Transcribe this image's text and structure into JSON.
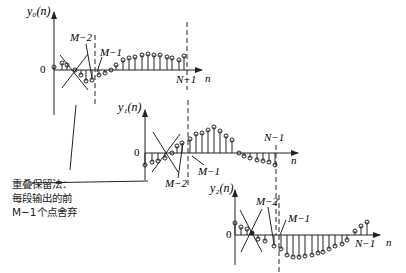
{
  "figure": {
    "colors": {
      "ink": "#222222",
      "background": "#ffffff"
    }
  },
  "panels": [
    {
      "ylabel": "y₀(n)",
      "zero_label": "0",
      "x_label": "n",
      "markers": {
        "m2": "M−2",
        "m1": "M−1",
        "n1": "N−1"
      }
    },
    {
      "ylabel": "y₁(n)",
      "zero_label": "0",
      "x_label": "n",
      "markers": {
        "m2": "M−2",
        "m1": "M−1",
        "n1": "N−1"
      }
    },
    {
      "ylabel": "y₂(n)",
      "zero_label": "0",
      "x_label": "n",
      "markers": {
        "m2": "M−2",
        "m1": "M−1",
        "n1": "N−1"
      }
    }
  ],
  "annotation": {
    "line1": "重叠保留法：",
    "line2": "每段输出的前",
    "line3": "M−1个点舍弃"
  }
}
